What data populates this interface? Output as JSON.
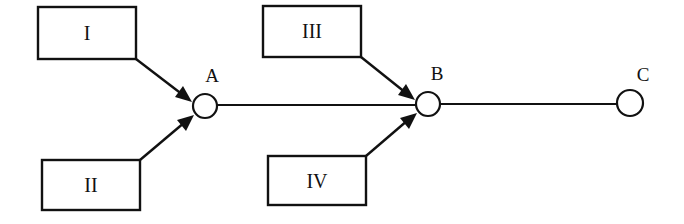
{
  "diagram": {
    "boxes": [
      {
        "id": "I",
        "label": "I",
        "target": "A"
      },
      {
        "id": "II",
        "label": "II",
        "target": "A"
      },
      {
        "id": "III",
        "label": "III",
        "target": "B"
      },
      {
        "id": "IV",
        "label": "IV",
        "target": "B"
      }
    ],
    "nodes": [
      {
        "id": "A",
        "label": "A"
      },
      {
        "id": "B",
        "label": "B"
      },
      {
        "id": "C",
        "label": "C"
      }
    ],
    "edges": [
      {
        "from": "A",
        "to": "B"
      },
      {
        "from": "B",
        "to": "C"
      }
    ],
    "colors": {
      "stroke": "#111111",
      "background": "#ffffff"
    }
  }
}
